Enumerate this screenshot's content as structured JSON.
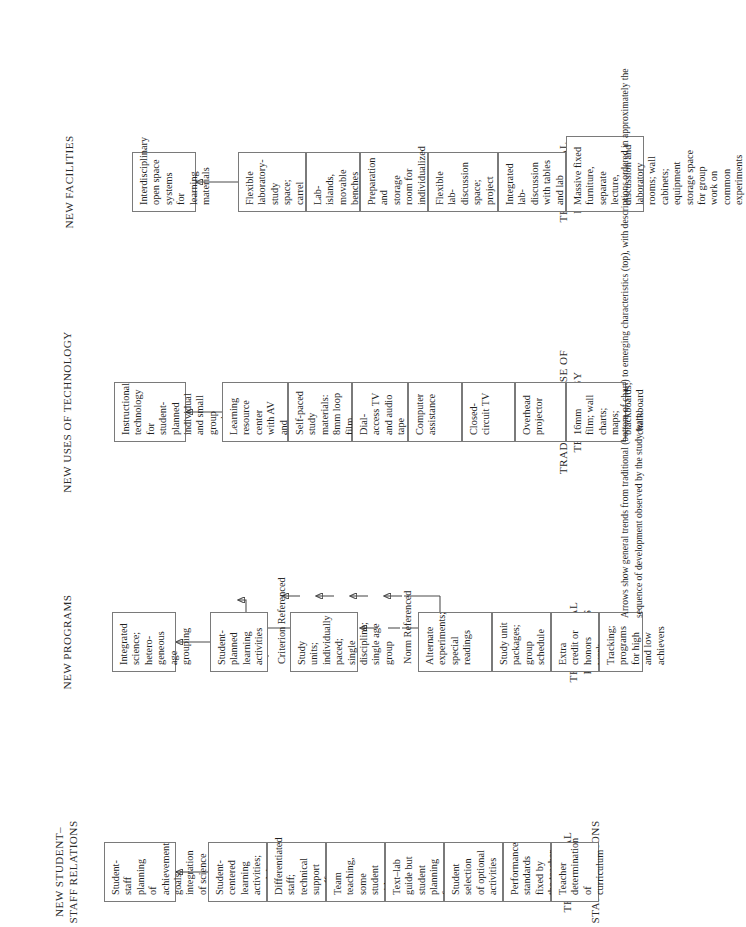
{
  "figure": {
    "caption": "Arrows show general trends from traditional (bottom of chart) to emerging characteristics (top), with descriptions  ordered in approximately the sequence of development observed by the study team."
  },
  "columns": [
    {
      "id": "facilities",
      "top_title": "NEW FACILITIES",
      "bottom_title": "TRADITIONAL FACILITIES",
      "boxes": [
        {
          "text": "Interdisciplinary open space systems for learning materials"
        },
        {
          "text": "Flexible laboratory-study space; carrel units, carpeting"
        },
        {
          "text": "Lab-islands, movable benches"
        },
        {
          "text": "Preparation and storage room for individualized packets"
        },
        {
          "text": "Flexible lab-discussion space; project areas, plant and animal rooms"
        },
        {
          "text": "Integrated lab-discussion with tables and lab benches"
        },
        {
          "text": "Massive fixed furniture, separate lecture, discussion and laboratory rooms; wall cabinets; equipment storage space for group work on common experiments"
        }
      ]
    },
    {
      "id": "technology",
      "top_title": "NEW USES OF TECHNOLOGY",
      "bottom_title": "TRADITIONAL USE OF\nTECHNOLOGY",
      "boxes": [
        {
          "text": "Instructional technology for student-planned individual and small group work"
        },
        {
          "text": "Learning resource center with AV and reference material"
        },
        {
          "text": "Self-paced study materials: 8mm loop film, filmstrip viewers"
        },
        {
          "text": "Dial-access TV and audio tape"
        },
        {
          "text": "Computer assistance"
        },
        {
          "text": "Closed-circuit TV"
        },
        {
          "text": "Overhead projector"
        },
        {
          "text": "16mm film; wall charts; maps; blackboards; chalkboard"
        }
      ]
    },
    {
      "id": "programs",
      "top_title": "NEW PROGRAMS",
      "bottom_title": "TRADITIONAL PROGRAMS",
      "subheads": [
        {
          "text": "Criterion Referenced"
        },
        {
          "text": "Norm Referenced"
        }
      ],
      "boxes": [
        {
          "text": "Integrated science; hetero-geneous age grouping"
        },
        {
          "text": "Student-planned learning activities"
        },
        {
          "text": "Study units; individually paced; single discipline; single age group"
        },
        {
          "text": "Alternate experiments; special readings"
        },
        {
          "text": "Study unit packages; group schedule"
        },
        {
          "text": "Extra credit or honors work"
        },
        {
          "text": "Tracking; programs for high and low achievers"
        },
        {
          "text": "Single subject; text-lab program group paced; group exams"
        }
      ]
    },
    {
      "id": "staff-relations",
      "top_title": "NEW STUDENT–\nSTAFF RELATIONS",
      "bottom_title": "TRADITIONAL STUDENT–\nSTAFF RELATIONS",
      "boxes": [
        {
          "text": "Student-staff planning of achievement goals; integration of science study with other student interests"
        },
        {
          "text": "Student-centered learning activities; modules; peer assistance"
        },
        {
          "text": "Differentiated staff; technical support staff"
        },
        {
          "text": "Team teaching, some student aides"
        },
        {
          "text": "Text–lab guide but student planning for projects"
        },
        {
          "text": "Student selection of optional activities"
        },
        {
          "text": "Performance standards fixed by the teacher"
        },
        {
          "text": "Teacher determination of curriculum"
        }
      ]
    }
  ],
  "colors": {
    "box_border": "#7a7a7a",
    "arrow": "#4a4a4a",
    "text": "#1f1f1f",
    "background": "#ffffff"
  }
}
